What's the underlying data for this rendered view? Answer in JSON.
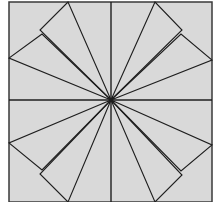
{
  "diagram": {
    "title": "",
    "canvas": {
      "width": 214,
      "height": 202
    },
    "colors": {
      "background": "#ffffff",
      "square_fill": "#d9d9d9",
      "stroke": "#1e1e1e",
      "border": "#3a3a3a"
    },
    "square": {
      "x": 9,
      "y": 2,
      "width": 203,
      "height": 200
    },
    "center": {
      "x": 111,
      "y": 100
    },
    "axes": [
      {
        "name": "vertical-axis-line",
        "x1": 111,
        "y1": 2,
        "x2": 111,
        "y2": 202
      },
      {
        "name": "horizontal-axis-line",
        "x1": 9,
        "y1": 100,
        "x2": 212,
        "y2": 100
      }
    ],
    "triangles": [
      {
        "name": "triangle-upper-left-outer",
        "points": "111,100 68,2 40,30"
      },
      {
        "name": "triangle-upper-left-inner",
        "points": "111,100 42,34 9,58"
      },
      {
        "name": "triangle-upper-right-outer",
        "points": "111,100 155,2 182,30"
      },
      {
        "name": "triangle-upper-right-inner",
        "points": "111,100 181,34 212,60"
      },
      {
        "name": "triangle-lower-left-outer",
        "points": "111,100 68,202 40,174"
      },
      {
        "name": "triangle-lower-left-inner",
        "points": "111,100 42,170 9,143"
      },
      {
        "name": "triangle-lower-right-outer",
        "points": "111,100 155,202 182,175"
      },
      {
        "name": "triangle-lower-right-inner",
        "points": "111,100 181,171 212,145"
      }
    ]
  }
}
